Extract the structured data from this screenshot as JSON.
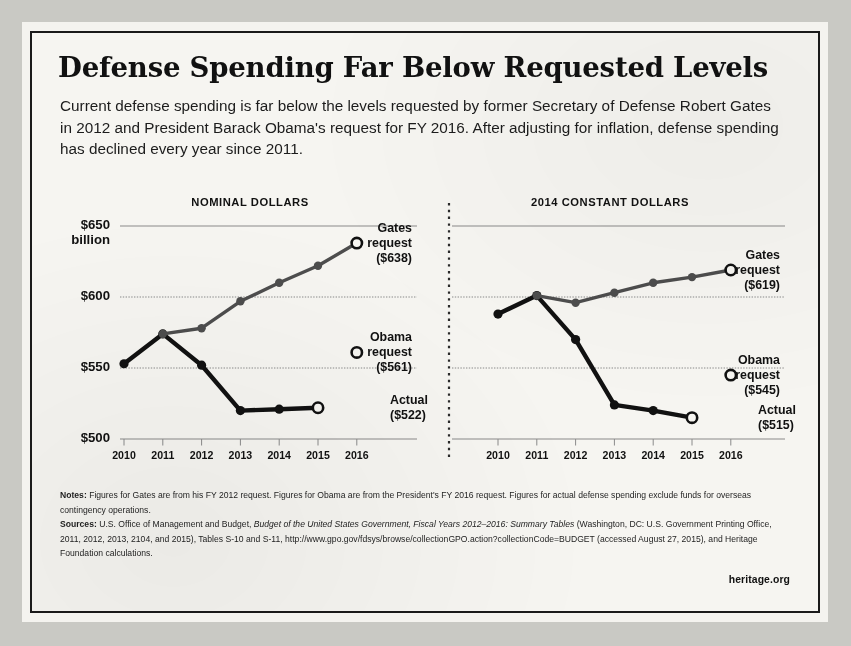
{
  "title": "Defense Spending Far Below Requested Levels",
  "subtitle": "Current defense spending is far below the levels requested by former Secretary of Defense Robert Gates in 2012 and President Barack Obama's request for FY 2016. After adjusting for inflation, defense spending has declined every year since 2011.",
  "brand": "heritage.org",
  "notes": {
    "notes_label": "Notes:",
    "notes_text": " Figures for Gates are from his FY 2012 request. Figures for Obama are from the President's FY 2016 request. Figures for actual defense spending exclude funds for overseas contingency operations.",
    "sources_label": "Sources:",
    "sources_text_1": " U.S. Office of Management and Budget, ",
    "sources_italic": "Budget of the United States Government, Fiscal Years 2012–2016: Summary Tables",
    "sources_text_2": " (Washington, DC: U.S. Government Printing Office, 2011, 2012, 2013, 2104, and 2015), Tables S-10 and S-11, http://www.gpo.gov/fdsys/browse/collectionGPO.action?collectionCode=BUDGET (accessed August 27, 2015), and Heritage Foundation calculations."
  },
  "axis": {
    "y_ticks": [
      "$650",
      "$600",
      "$550",
      "$500"
    ],
    "y_unit": "billion",
    "y_values": [
      650,
      600,
      550,
      500
    ],
    "x_ticks": [
      "2010",
      "2011",
      "2012",
      "2013",
      "2014",
      "2015",
      "2016"
    ]
  },
  "colors": {
    "actual": "#111111",
    "gates": "#4d4d4d",
    "grid": "#8a8a8a",
    "paper": "#f6f5f1",
    "ink": "#111111"
  },
  "chart_data": [
    {
      "type": "line",
      "title": "NOMINAL DOLLARS",
      "xlabel": "",
      "ylabel": "$ billion",
      "x": [
        2010,
        2011,
        2012,
        2013,
        2014,
        2015,
        2016
      ],
      "ylim": [
        490,
        660
      ],
      "xlim": [
        2009.6,
        2016.4
      ],
      "grid": true,
      "yticks": [
        500,
        550,
        600,
        650
      ],
      "series": [
        {
          "name": "Actual",
          "color": "#111111",
          "marker": "filled-circle",
          "x": [
            2010,
            2011,
            2012,
            2013,
            2014,
            2015
          ],
          "values": [
            553,
            574,
            552,
            520,
            521,
            522
          ],
          "open_marker_at": 2015
        },
        {
          "name": "Gates request",
          "color": "#4d4d4d",
          "marker": "filled-circle",
          "x": [
            2011,
            2012,
            2013,
            2014,
            2015,
            2016
          ],
          "values": [
            574,
            578,
            597,
            610,
            622,
            638
          ],
          "open_marker_at": 2016
        },
        {
          "name": "Obama request",
          "color": "#111111",
          "marker": "open-circle",
          "x": [
            2016
          ],
          "values": [
            561
          ]
        }
      ],
      "annotations": [
        {
          "name": "gates-label",
          "lines": [
            "Gates",
            "request",
            "($638)"
          ],
          "value": 638
        },
        {
          "name": "obama-label",
          "lines": [
            "Obama",
            "request",
            "($561)"
          ],
          "value": 561
        },
        {
          "name": "actual-label",
          "lines": [
            "Actual",
            "($522)"
          ],
          "value": 522
        }
      ]
    },
    {
      "type": "line",
      "title": "2014 CONSTANT DOLLARS",
      "xlabel": "",
      "ylabel": "$ billion",
      "x": [
        2010,
        2011,
        2012,
        2013,
        2014,
        2015,
        2016
      ],
      "ylim": [
        490,
        660
      ],
      "xlim": [
        2009.6,
        2016.4
      ],
      "grid": true,
      "yticks": [
        500,
        550,
        600,
        650
      ],
      "series": [
        {
          "name": "Actual",
          "color": "#111111",
          "marker": "filled-circle",
          "x": [
            2010,
            2011,
            2012,
            2013,
            2014,
            2015
          ],
          "values": [
            588,
            601,
            570,
            524,
            520,
            515
          ],
          "open_marker_at": 2015
        },
        {
          "name": "Gates request",
          "color": "#4d4d4d",
          "marker": "filled-circle",
          "x": [
            2011,
            2012,
            2013,
            2014,
            2015,
            2016
          ],
          "values": [
            601,
            596,
            603,
            610,
            614,
            619
          ],
          "open_marker_at": 2016
        },
        {
          "name": "Obama request",
          "color": "#111111",
          "marker": "open-circle",
          "x": [
            2016
          ],
          "values": [
            545
          ]
        }
      ],
      "annotations": [
        {
          "name": "gates-label",
          "lines": [
            "Gates",
            "request",
            "($619)"
          ],
          "value": 619
        },
        {
          "name": "obama-label",
          "lines": [
            "Obama",
            "request",
            "($545)"
          ],
          "value": 545
        },
        {
          "name": "actual-label",
          "lines": [
            "Actual",
            "($515)"
          ],
          "value": 515
        }
      ]
    }
  ]
}
